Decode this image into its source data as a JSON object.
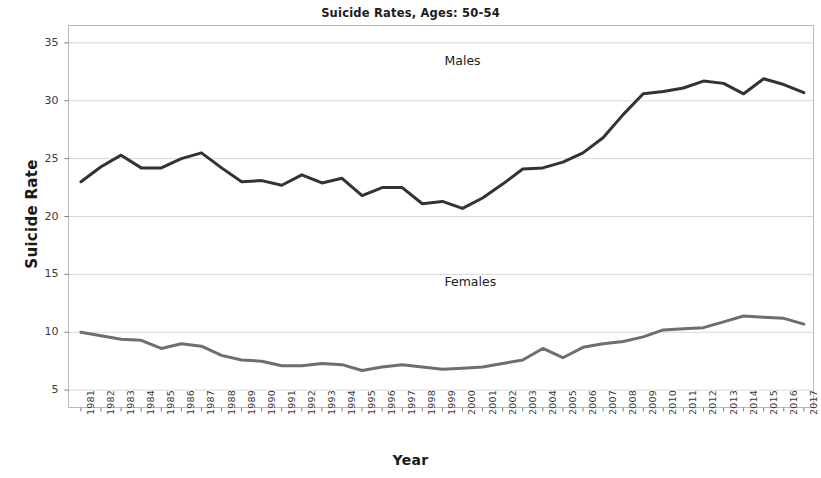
{
  "chart_data": {
    "type": "line",
    "title": "Suicide Rates, Ages: 50-54",
    "xlabel": "Year",
    "ylabel": "Suicide Rate",
    "grid": true,
    "legend_position": "inline-annotation",
    "xlim": [
      1981,
      2017
    ],
    "ylim": [
      3.5,
      36.5
    ],
    "yticks": [
      5,
      10,
      15,
      20,
      25,
      30,
      35
    ],
    "categories": [
      1981,
      1982,
      1983,
      1984,
      1985,
      1986,
      1987,
      1988,
      1989,
      1990,
      1991,
      1992,
      1993,
      1994,
      1995,
      1996,
      1997,
      1998,
      1999,
      2000,
      2001,
      2002,
      2003,
      2004,
      2005,
      2006,
      2007,
      2008,
      2009,
      2010,
      2011,
      2012,
      2013,
      2014,
      2015,
      2016,
      2017
    ],
    "series": [
      {
        "name": "Males",
        "color": "#333333",
        "values": [
          23.0,
          24.3,
          25.3,
          24.2,
          24.2,
          25.0,
          25.5,
          24.2,
          23.0,
          23.1,
          22.7,
          23.6,
          22.9,
          23.3,
          21.8,
          22.5,
          22.5,
          21.1,
          21.3,
          20.7,
          21.6,
          22.8,
          24.1,
          24.2,
          24.7,
          25.5,
          26.8,
          28.8,
          30.6,
          30.8,
          31.1,
          31.7,
          31.5,
          30.6,
          31.9,
          31.4,
          30.7
        ]
      },
      {
        "name": "Females",
        "color": "#6e6e6e",
        "values": [
          10.0,
          9.7,
          9.4,
          9.3,
          8.6,
          9.0,
          8.8,
          8.0,
          7.6,
          7.5,
          7.1,
          7.1,
          7.3,
          7.2,
          6.7,
          7.0,
          7.2,
          7.0,
          6.8,
          6.9,
          7.0,
          7.3,
          7.6,
          8.6,
          7.8,
          8.7,
          9.0,
          9.2,
          9.6,
          10.2,
          10.3,
          10.4,
          10.9,
          11.4,
          11.3,
          11.2,
          10.7
        ]
      }
    ],
    "annotations": [
      {
        "text": "Males",
        "x_year": 2000,
        "y_value": 33.4
      },
      {
        "text": "Females",
        "x_year": 2000,
        "y_value": 14.3
      }
    ]
  }
}
